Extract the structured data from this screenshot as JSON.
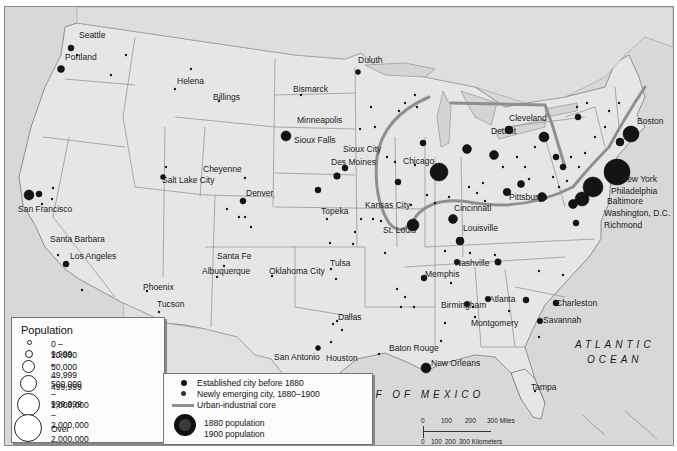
{
  "map": {
    "subject": "Urbanization of the United States, 1880-1900",
    "colors": {
      "land": "#e4e4e4",
      "water": "#d6d6d6",
      "border": "#7a7a7a",
      "city": "#141414",
      "core_band": "#8f8f8f"
    },
    "city_labels": [
      {
        "name": "Seattle",
        "x": 78,
        "y": 34
      },
      {
        "name": "Portland",
        "x": 64,
        "y": 56
      },
      {
        "name": "Helena",
        "x": 176,
        "y": 80
      },
      {
        "name": "Billings",
        "x": 212,
        "y": 96
      },
      {
        "name": "Bismarck",
        "x": 292,
        "y": 88
      },
      {
        "name": "Duluth",
        "x": 357,
        "y": 59
      },
      {
        "name": "Minneapolis",
        "x": 296,
        "y": 119
      },
      {
        "name": "Sioux Falls",
        "x": 293,
        "y": 139
      },
      {
        "name": "Sioux City",
        "x": 342,
        "y": 148
      },
      {
        "name": "Des Moines",
        "x": 330,
        "y": 161
      },
      {
        "name": "Chicago",
        "x": 402,
        "y": 160
      },
      {
        "name": "Detroit",
        "x": 490,
        "y": 130
      },
      {
        "name": "Cleveland",
        "x": 508,
        "y": 117
      },
      {
        "name": "Boston",
        "x": 636,
        "y": 120
      },
      {
        "name": "New York",
        "x": 620,
        "y": 178
      },
      {
        "name": "Philadelphia",
        "x": 610,
        "y": 190
      },
      {
        "name": "Baltimore",
        "x": 606,
        "y": 200
      },
      {
        "name": "Washington, D.C.",
        "x": 603,
        "y": 212
      },
      {
        "name": "Richmond",
        "x": 603,
        "y": 224
      },
      {
        "name": "Pittsburgh",
        "x": 508,
        "y": 196
      },
      {
        "name": "Cincinnati",
        "x": 453,
        "y": 207
      },
      {
        "name": "Louisville",
        "x": 462,
        "y": 227
      },
      {
        "name": "Kansas City",
        "x": 364,
        "y": 204
      },
      {
        "name": "St. Louis",
        "x": 382,
        "y": 229
      },
      {
        "name": "Topeka",
        "x": 320,
        "y": 210
      },
      {
        "name": "Cheyenne",
        "x": 202,
        "y": 168
      },
      {
        "name": "Denver",
        "x": 245,
        "y": 192
      },
      {
        "name": "Salt Lake City",
        "x": 161,
        "y": 179
      },
      {
        "name": "San Francisco",
        "x": 17,
        "y": 208
      },
      {
        "name": "Santa Barbara",
        "x": 49,
        "y": 238
      },
      {
        "name": "Los Angeles",
        "x": 69,
        "y": 255
      },
      {
        "name": "Santa Fe",
        "x": 216,
        "y": 255
      },
      {
        "name": "Albuquerque",
        "x": 201,
        "y": 270
      },
      {
        "name": "Phoenix",
        "x": 142,
        "y": 286
      },
      {
        "name": "Tucson",
        "x": 156,
        "y": 303
      },
      {
        "name": "Oklahoma City",
        "x": 268,
        "y": 270
      },
      {
        "name": "Tulsa",
        "x": 329,
        "y": 262
      },
      {
        "name": "Memphis",
        "x": 424,
        "y": 273
      },
      {
        "name": "Nashville",
        "x": 454,
        "y": 262
      },
      {
        "name": "Atlanta",
        "x": 488,
        "y": 298
      },
      {
        "name": "Birmingham",
        "x": 440,
        "y": 304
      },
      {
        "name": "Montgomery",
        "x": 470,
        "y": 322
      },
      {
        "name": "Charleston",
        "x": 555,
        "y": 302
      },
      {
        "name": "Savannah",
        "x": 542,
        "y": 319
      },
      {
        "name": "Dallas",
        "x": 337,
        "y": 316
      },
      {
        "name": "San Antonio",
        "x": 273,
        "y": 356
      },
      {
        "name": "Houston",
        "x": 325,
        "y": 357
      },
      {
        "name": "Baton Rouge",
        "x": 388,
        "y": 347
      },
      {
        "name": "New Orleans",
        "x": 430,
        "y": 362
      },
      {
        "name": "Tampa",
        "x": 530,
        "y": 386
      }
    ],
    "water_labels": {
      "atlantic_line1": "ATLANTIC",
      "atlantic_line2": "OCEAN",
      "gulf": "GULF OF MEXICO"
    }
  },
  "legend": {
    "population": {
      "title": "Population",
      "items": [
        {
          "label": "0 – 9,999",
          "size": 3
        },
        {
          "label": "10,000 – 49,999",
          "size": 6
        },
        {
          "label": "50,000 – 499,999",
          "size": 11
        },
        {
          "label": "500,000 – 999,999",
          "size": 15
        },
        {
          "label": "1,000,000 – 2,000,000",
          "size": 21
        },
        {
          "label": "Over 2,000,000",
          "size": 26
        }
      ]
    },
    "symbols": {
      "established": "Established city before 1880",
      "emerging": "Newly emerging city, 1880–1900",
      "core": "Urban-industrial core",
      "pop1880": "1880 population",
      "pop1900": "1900 population"
    }
  },
  "scale_bar": {
    "miles": [
      "0",
      "100",
      "200",
      "300 Miles"
    ],
    "kilometers": [
      "0",
      "100",
      "200",
      "300 Kilometers"
    ]
  }
}
